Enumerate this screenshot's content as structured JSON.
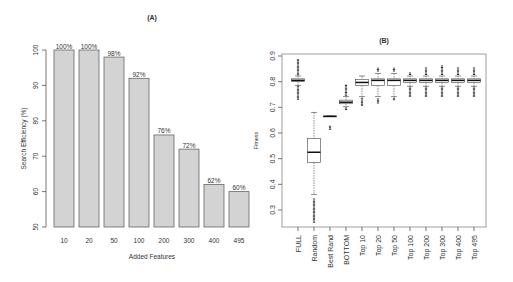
{
  "chart_data": [
    {
      "type": "bar",
      "title": "(A)",
      "xlabel": "Added Features",
      "ylabel": "Search Efficiency (%)",
      "categories": [
        "10",
        "20",
        "50",
        "100",
        "200",
        "300",
        "400",
        "495"
      ],
      "values": [
        100,
        100,
        98,
        92,
        76,
        72,
        62,
        60
      ],
      "data_labels": [
        "100%",
        "100%",
        "98%",
        "92%",
        "76%",
        "72%",
        "62%",
        "60%"
      ],
      "ylim": [
        50,
        100
      ],
      "yticks": [
        50,
        60,
        70,
        80,
        90,
        100
      ],
      "bar_color": "#d3d3d3",
      "grid": false
    },
    {
      "type": "boxplot",
      "title": "(B)",
      "xlabel": "",
      "ylabel": "Fitness",
      "categories": [
        "FULL",
        "Random",
        "Best Rand",
        "BOTTOM",
        "Top 10",
        "Top 20",
        "Top 50",
        "Top 100",
        "Top 200",
        "Top 300",
        "Top 400",
        "Top 495"
      ],
      "ylim": [
        0.23,
        0.92
      ],
      "yticks": [
        0.3,
        0.4,
        0.5,
        0.6,
        0.7,
        0.8,
        0.9
      ],
      "grid": false,
      "boxes": [
        {
          "name": "FULL",
          "q1": 0.8,
          "median": 0.805,
          "q3": 0.811,
          "whisker_low": 0.785,
          "whisker_high": 0.822,
          "outliers_low": [
            0.73,
            0.785
          ],
          "outliers_high": [
            0.825,
            0.89
          ]
        },
        {
          "name": "Random",
          "q1": 0.485,
          "median": 0.525,
          "q3": 0.578,
          "whisker_low": 0.36,
          "whisker_high": 0.68,
          "outliers_low": [
            0.25,
            0.345
          ],
          "outliers_high": null
        },
        {
          "name": "Best Rand",
          "q1": 0.665,
          "median": 0.665,
          "q3": 0.666,
          "whisker_low": 0.665,
          "whisker_high": 0.666,
          "outliers_low": [
            0.613,
            0.63
          ],
          "outliers_high": null
        },
        {
          "name": "BOTTOM",
          "q1": 0.714,
          "median": 0.72,
          "q3": 0.728,
          "whisker_low": 0.703,
          "whisker_high": 0.742,
          "outliers_low": [
            0.69,
            0.7
          ],
          "outliers_high": [
            0.745,
            0.79
          ]
        },
        {
          "name": "Top 10",
          "q1": 0.785,
          "median": 0.797,
          "q3": 0.809,
          "whisker_low": 0.742,
          "whisker_high": 0.822,
          "outliers_low": [
            0.705,
            0.738
          ],
          "outliers_high": null
        },
        {
          "name": "Top 20",
          "q1": 0.785,
          "median": 0.805,
          "q3": 0.811,
          "whisker_low": 0.742,
          "whisker_high": 0.832,
          "outliers_low": [
            0.715,
            0.735
          ],
          "outliers_high": [
            0.84,
            0.855
          ]
        },
        {
          "name": "Top 50",
          "q1": 0.785,
          "median": 0.805,
          "q3": 0.811,
          "whisker_low": 0.742,
          "whisker_high": 0.832,
          "outliers_low": [
            0.728,
            0.738
          ],
          "outliers_high": [
            0.84,
            0.855
          ]
        },
        {
          "name": "Top 100",
          "q1": 0.797,
          "median": 0.805,
          "q3": 0.811,
          "whisker_low": 0.782,
          "whisker_high": 0.822,
          "outliers_low": [
            0.74,
            0.78
          ],
          "outliers_high": [
            0.826,
            0.838
          ]
        },
        {
          "name": "Top 200",
          "q1": 0.797,
          "median": 0.805,
          "q3": 0.811,
          "whisker_low": 0.782,
          "whisker_high": 0.822,
          "outliers_low": [
            0.74,
            0.78
          ],
          "outliers_high": [
            0.826,
            0.855
          ]
        },
        {
          "name": "Top 300",
          "q1": 0.797,
          "median": 0.805,
          "q3": 0.811,
          "whisker_low": 0.782,
          "whisker_high": 0.822,
          "outliers_low": [
            0.74,
            0.78
          ],
          "outliers_high": [
            0.826,
            0.865
          ]
        },
        {
          "name": "Top 400",
          "q1": 0.797,
          "median": 0.805,
          "q3": 0.811,
          "whisker_low": 0.782,
          "whisker_high": 0.822,
          "outliers_low": [
            0.74,
            0.78
          ],
          "outliers_high": [
            0.826,
            0.855
          ]
        },
        {
          "name": "Top 495",
          "q1": 0.797,
          "median": 0.805,
          "q3": 0.811,
          "whisker_low": 0.782,
          "whisker_high": 0.822,
          "outliers_low": [
            0.74,
            0.78
          ],
          "outliers_high": [
            0.826,
            0.855
          ]
        }
      ]
    }
  ]
}
